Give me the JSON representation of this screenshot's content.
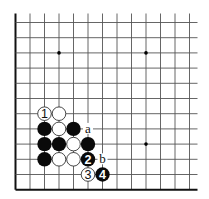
{
  "diagram": {
    "type": "go-board-corner",
    "corner": "bottom-left",
    "columns": 13,
    "rows": 12,
    "grid": {
      "origin_x": 15.5,
      "origin_y": 22.5,
      "step_x": 14.5,
      "step_y": 15.2,
      "line_color": "#555555",
      "edge_color": "#111111",
      "extend_top": 9,
      "extend_right": 8
    },
    "star_points": [
      {
        "col": 3,
        "row": 2
      },
      {
        "col": 9,
        "row": 2
      },
      {
        "col": 9,
        "row": 8
      }
    ],
    "stones": [
      {
        "col": 2,
        "row": 6,
        "color": "white",
        "label": "1"
      },
      {
        "col": 3,
        "row": 6,
        "color": "white",
        "label": ""
      },
      {
        "col": 2,
        "row": 7,
        "color": "black",
        "label": ""
      },
      {
        "col": 3,
        "row": 7,
        "color": "white",
        "label": ""
      },
      {
        "col": 4,
        "row": 7,
        "color": "black",
        "label": ""
      },
      {
        "col": 2,
        "row": 8,
        "color": "black",
        "label": ""
      },
      {
        "col": 3,
        "row": 8,
        "color": "black",
        "label": ""
      },
      {
        "col": 4,
        "row": 8,
        "color": "white",
        "label": ""
      },
      {
        "col": 5,
        "row": 8,
        "color": "black",
        "label": ""
      },
      {
        "col": 2,
        "row": 9,
        "color": "black",
        "label": ""
      },
      {
        "col": 3,
        "row": 9,
        "color": "white",
        "label": ""
      },
      {
        "col": 4,
        "row": 9,
        "color": "white",
        "label": ""
      },
      {
        "col": 5,
        "row": 9,
        "color": "black",
        "label": "2"
      },
      {
        "col": 5,
        "row": 10,
        "color": "white",
        "label": "3"
      },
      {
        "col": 6,
        "row": 10,
        "color": "black",
        "label": "4"
      }
    ],
    "point_labels": [
      {
        "col": 5,
        "row": 7,
        "text": "a"
      },
      {
        "col": 6,
        "row": 9,
        "text": "b"
      }
    ],
    "colors": {
      "black_stone": "#0a0a0a",
      "white_stone": "#ffffff",
      "white_stone_border": "#333333",
      "black_label": "#ffffff",
      "white_label": "#111111"
    }
  }
}
